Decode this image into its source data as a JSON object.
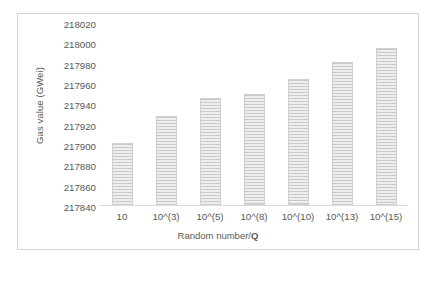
{
  "chart_data": {
    "type": "bar",
    "title": "",
    "xlabel": "Random number/Q",
    "xlabel_plain": "Random number/",
    "xlabel_bold": "Q",
    "ylabel": "Gas value (GWei)",
    "categories": [
      "10",
      "10^(3)",
      "10^(5)",
      "10^(8)",
      "10^(10)",
      "10^(13)",
      "10^(15)"
    ],
    "values": [
      217903,
      217931,
      217949,
      217953,
      217968,
      217985,
      218000
    ],
    "ylim": [
      217840,
      218020
    ],
    "ytick_step": 20,
    "yticks": [
      "218020",
      "218000",
      "217980",
      "217960",
      "217940",
      "217920",
      "217900",
      "217880",
      "217860",
      "217840"
    ],
    "grid": false,
    "legend": "none",
    "series": [
      {
        "name": "Gas value",
        "values": [
          217903,
          217931,
          217949,
          217953,
          217968,
          217985,
          218000
        ]
      }
    ],
    "bar_color": "#d9d9d9",
    "bar_pattern": "horizontal-stripes",
    "axis_color": "#d9d9d9",
    "text_color": "#595959",
    "border_color": "#d4d4d4"
  },
  "caption": {
    "text": ""
  }
}
